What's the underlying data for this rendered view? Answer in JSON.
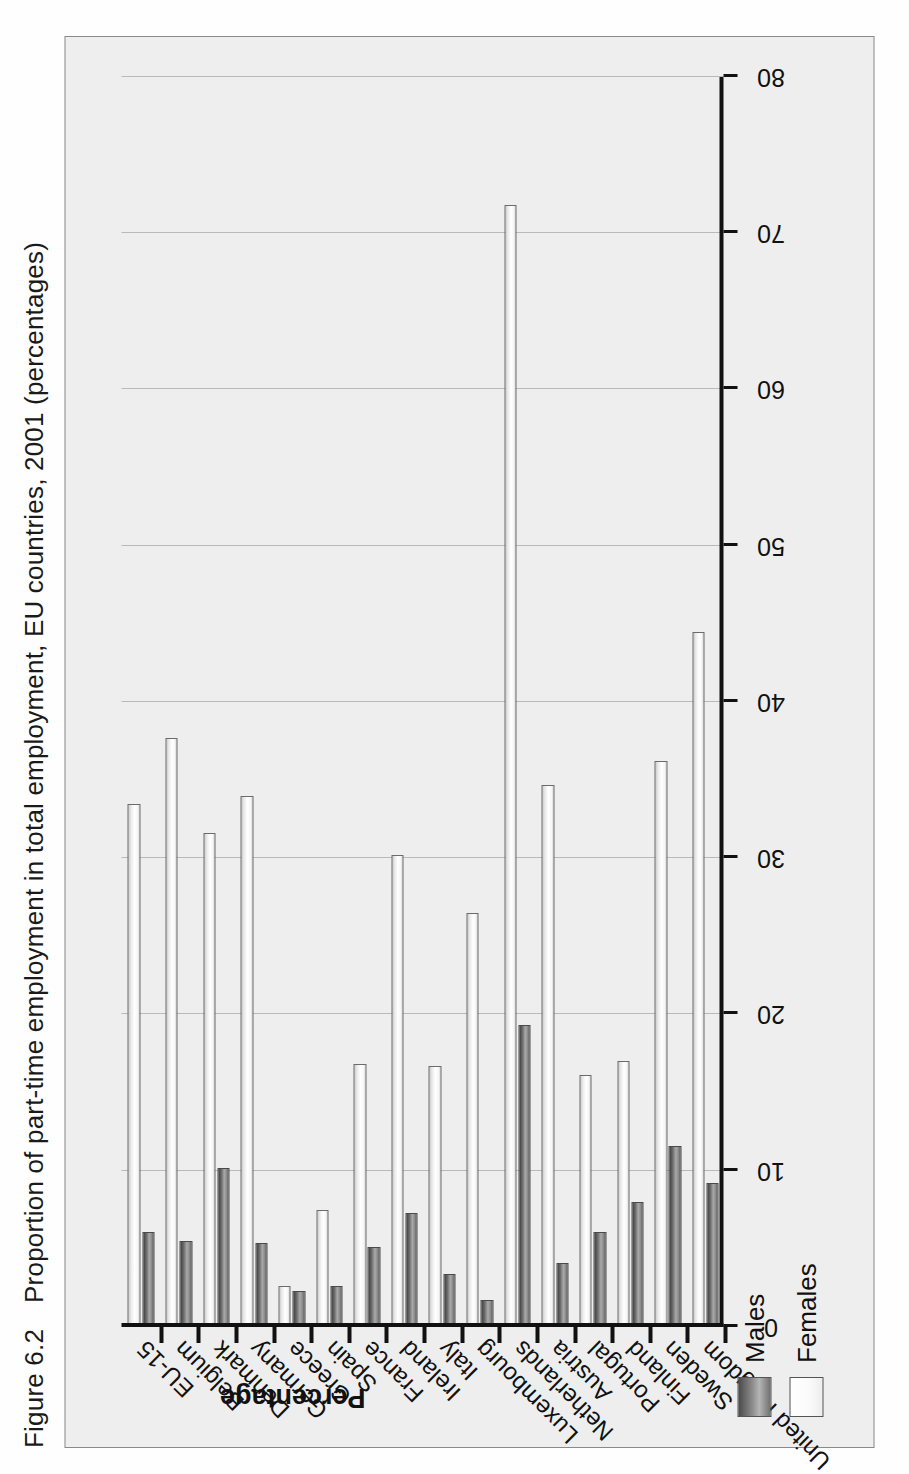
{
  "figure": {
    "number": "Figure 6.2",
    "title": "Proportion of part-time employment in total employment, EU countries, 2001 (percentages)"
  },
  "legend": {
    "position": "bottom-left",
    "items": [
      {
        "label": "Males",
        "swatch": "males-swatch",
        "color": "#7f7f7f"
      },
      {
        "label": "Females",
        "swatch": "females-swatch",
        "color": "#ffffff"
      }
    ]
  },
  "axis": {
    "value_axis_label": "Percentage",
    "tick_labels": [
      "80",
      "70",
      "60",
      "50",
      "40",
      "30",
      "20",
      "10",
      "0"
    ]
  },
  "chart_data": {
    "type": "bar",
    "orientation": "horizontal-rotated",
    "title": "Proportion of part-time employment in total employment, EU countries, 2001 (percentages)",
    "xlabel": "",
    "ylabel": "Percentage",
    "ylim": [
      0,
      80
    ],
    "ytick_step": 10,
    "grid": true,
    "legend_position": "bottom-left",
    "categories": [
      "EU-15",
      "Belgium",
      "Denmark",
      "Germany",
      "Greece",
      "Spain",
      "France",
      "Ireland",
      "Italy",
      "Luxembourg",
      "Netherlands",
      "Austria",
      "Portugal",
      "Finland",
      "Sweden",
      "United Kingdom"
    ],
    "series": [
      {
        "name": "Males",
        "values": [
          6.1,
          5.5,
          10.2,
          5.4,
          2.3,
          2.6,
          5.1,
          7.3,
          3.4,
          1.7,
          19.3,
          4.1,
          6.1,
          8.0,
          11.6,
          9.2
        ]
      },
      {
        "name": "Females",
        "values": [
          33.5,
          37.7,
          31.6,
          34.0,
          2.6,
          7.5,
          16.8,
          30.2,
          16.7,
          26.5,
          71.8,
          34.7,
          16.1,
          17.0,
          36.2,
          44.5
        ]
      }
    ]
  }
}
